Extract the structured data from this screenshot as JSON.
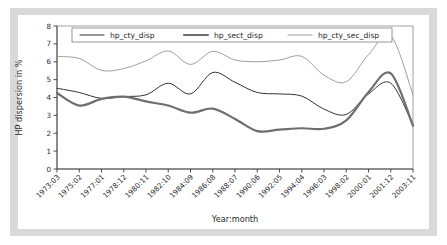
{
  "chart_data": {
    "type": "line",
    "title": "",
    "xlabel": "Year:month",
    "ylabel": "HP dispersion in %",
    "ylim": [
      0,
      8
    ],
    "yticks": [
      0,
      1,
      2,
      3,
      4,
      5,
      6,
      7,
      8
    ],
    "grid": false,
    "legend_position": "top-inside",
    "categories": [
      "1973:03",
      "1975:02",
      "1977:01",
      "1978:12",
      "1980:11",
      "1982:10",
      "1984:09",
      "1986:08",
      "1988:07",
      "1990:06",
      "1992:05",
      "1994:04",
      "1996:03",
      "1998:02",
      "2000:01",
      "2001:12",
      "2003:11"
    ],
    "series": [
      {
        "name": "hp_cty_disp",
        "color": "#333333",
        "width": 1.0,
        "values": [
          4.52,
          4.28,
          3.95,
          4.05,
          4.15,
          4.8,
          4.2,
          5.4,
          4.85,
          4.28,
          4.2,
          4.08,
          3.35,
          3.05,
          4.2,
          4.8,
          2.45
        ]
      },
      {
        "name": "hp_sect_disp",
        "color": "#6e6e6e",
        "width": 2.2,
        "values": [
          4.25,
          3.55,
          3.92,
          4.05,
          3.78,
          3.55,
          3.15,
          3.38,
          2.8,
          2.12,
          2.2,
          2.28,
          2.25,
          2.72,
          4.3,
          5.35,
          2.42
        ]
      },
      {
        "name": "hp_cty_sec_disp",
        "color": "#8c8c8c",
        "width": 0.85,
        "values": [
          6.3,
          6.18,
          5.52,
          5.62,
          6.05,
          6.6,
          5.85,
          6.58,
          6.1,
          6.0,
          6.1,
          6.3,
          5.25,
          4.88,
          6.4,
          7.45,
          4.15
        ]
      }
    ]
  },
  "legend": {
    "items": [
      {
        "label": "hp_cty_disp"
      },
      {
        "label": "hp_sect_disp"
      },
      {
        "label": "hp_cty_sec_disp"
      }
    ]
  },
  "axes": {
    "y_title": "HP dispersion in %",
    "x_title": "Year:month"
  }
}
